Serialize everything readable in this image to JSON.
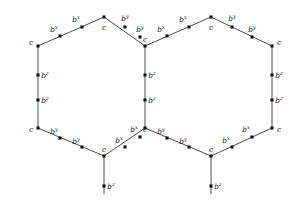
{
  "figure": {
    "type": "labeled-graph-diagram",
    "colors": {
      "edge": "#3a3a3a",
      "node": "#141414",
      "label": "#1a1a1a",
      "background": "#ffffff"
    },
    "labels": {
      "corner": "c",
      "b": "b",
      "sup_x": "x",
      "sup_y": "y",
      "sup_z": "z"
    },
    "vertices": [
      {
        "id": "c-top-left",
        "kind": "corner",
        "label": "c",
        "sup": "",
        "x": 38,
        "y": 46,
        "lx": 31,
        "ly": 45
      },
      {
        "id": "c-top-mid-left",
        "kind": "corner",
        "label": "c",
        "sup": "",
        "x": 104,
        "y": 17,
        "lx": 104,
        "ly": 30
      },
      {
        "id": "c-center-top",
        "kind": "corner",
        "label": "c",
        "sup": "",
        "x": 145,
        "y": 46,
        "lx": 145,
        "ly": 42
      },
      {
        "id": "c-top-mid-right",
        "kind": "corner",
        "label": "c",
        "sup": "",
        "x": 211,
        "y": 17,
        "lx": 211,
        "ly": 30
      },
      {
        "id": "c-top-right",
        "kind": "corner",
        "label": "c",
        "sup": "",
        "x": 272,
        "y": 46,
        "lx": 279,
        "ly": 45
      },
      {
        "id": "c-bot-left",
        "kind": "corner",
        "label": "c",
        "sup": "",
        "x": 38,
        "y": 128,
        "lx": 31,
        "ly": 132
      },
      {
        "id": "c-bot-mid-left",
        "kind": "corner",
        "label": "c",
        "sup": "",
        "x": 104,
        "y": 156,
        "lx": 104,
        "ly": 152
      },
      {
        "id": "c-center-bot",
        "kind": "corner",
        "label": "c",
        "sup": "",
        "x": 145,
        "y": 128,
        "lx": 145,
        "ly": 132
      },
      {
        "id": "c-bot-mid-right",
        "kind": "corner",
        "label": "c",
        "sup": "",
        "x": 211,
        "y": 156,
        "lx": 211,
        "ly": 152
      },
      {
        "id": "c-bot-right",
        "kind": "corner",
        "label": "c",
        "sup": "",
        "x": 272,
        "y": 128,
        "lx": 279,
        "ly": 132
      },
      {
        "id": "b-tl-1",
        "kind": "mid",
        "label": "b",
        "sup": "x",
        "x": 60,
        "y": 36,
        "lx": 54,
        "ly": 32
      },
      {
        "id": "b-tl-2",
        "kind": "mid",
        "label": "b",
        "sup": "x",
        "x": 82,
        "y": 27,
        "lx": 76,
        "ly": 22
      },
      {
        "id": "b-tr-1",
        "kind": "mid",
        "label": "b",
        "sup": "y",
        "x": 125,
        "y": 27,
        "lx": 125,
        "ly": 21
      },
      {
        "id": "b-tr-2",
        "kind": "mid",
        "label": "b",
        "sup": "y",
        "x": 140,
        "y": 37,
        "lx": 140,
        "ly": 32
      },
      {
        "id": "b-tl2-1",
        "kind": "mid",
        "label": "b",
        "sup": "x",
        "x": 167,
        "y": 36,
        "lx": 161,
        "ly": 32
      },
      {
        "id": "b-tl2-2",
        "kind": "mid",
        "label": "b",
        "sup": "x",
        "x": 189,
        "y": 27,
        "lx": 183,
        "ly": 22
      },
      {
        "id": "b-tr2-1",
        "kind": "mid",
        "label": "b",
        "sup": "y",
        "x": 232,
        "y": 27,
        "lx": 232,
        "ly": 21
      },
      {
        "id": "b-tr2-2",
        "kind": "mid",
        "label": "b",
        "sup": "y",
        "x": 252,
        "y": 37,
        "lx": 252,
        "ly": 32
      },
      {
        "id": "b-lv-1",
        "kind": "mid",
        "label": "b",
        "sup": "z",
        "x": 38,
        "y": 75,
        "lx": 45,
        "ly": 78
      },
      {
        "id": "b-lv-2",
        "kind": "mid",
        "label": "b",
        "sup": "z",
        "x": 38,
        "y": 100,
        "lx": 45,
        "ly": 103
      },
      {
        "id": "b-cv-1",
        "kind": "mid",
        "label": "b",
        "sup": "z",
        "x": 145,
        "y": 75,
        "lx": 152,
        "ly": 78
      },
      {
        "id": "b-cv-2",
        "kind": "mid",
        "label": "b",
        "sup": "z",
        "x": 145,
        "y": 100,
        "lx": 152,
        "ly": 103
      },
      {
        "id": "b-rv-1",
        "kind": "mid",
        "label": "b",
        "sup": "z",
        "x": 272,
        "y": 75,
        "lx": 279,
        "ly": 78
      },
      {
        "id": "b-rv-2",
        "kind": "mid",
        "label": "b",
        "sup": "z",
        "x": 272,
        "y": 100,
        "lx": 279,
        "ly": 103
      },
      {
        "id": "b-bl-1",
        "kind": "mid",
        "label": "b",
        "sup": "y",
        "x": 60,
        "y": 138,
        "lx": 54,
        "ly": 134
      },
      {
        "id": "b-bl-2",
        "kind": "mid",
        "label": "b",
        "sup": "y",
        "x": 82,
        "y": 147,
        "lx": 76,
        "ly": 144
      },
      {
        "id": "b-br-1",
        "kind": "mid",
        "label": "b",
        "sup": "x",
        "x": 125,
        "y": 147,
        "lx": 119,
        "ly": 143
      },
      {
        "id": "b-br-2",
        "kind": "mid",
        "label": "b",
        "sup": "x",
        "x": 140,
        "y": 137,
        "lx": 134,
        "ly": 132
      },
      {
        "id": "b-bl2-1",
        "kind": "mid",
        "label": "b",
        "sup": "y",
        "x": 167,
        "y": 138,
        "lx": 161,
        "ly": 134
      },
      {
        "id": "b-bl2-2",
        "kind": "mid",
        "label": "b",
        "sup": "y",
        "x": 189,
        "y": 147,
        "lx": 183,
        "ly": 144
      },
      {
        "id": "b-br2-1",
        "kind": "mid",
        "label": "b",
        "sup": "x",
        "x": 232,
        "y": 147,
        "lx": 226,
        "ly": 143
      },
      {
        "id": "b-br2-2",
        "kind": "mid",
        "label": "b",
        "sup": "x",
        "x": 252,
        "y": 137,
        "lx": 246,
        "ly": 132
      },
      {
        "id": "b-pend-left",
        "kind": "pendant",
        "label": "b",
        "sup": "z",
        "x": 104,
        "y": 186,
        "lx": 111,
        "ly": 189
      },
      {
        "id": "b-pend-right",
        "kind": "pendant",
        "label": "b",
        "sup": "z",
        "x": 211,
        "y": 186,
        "lx": 218,
        "ly": 189
      }
    ],
    "edges": [
      {
        "id": "e-top-left-up",
        "x1": 38,
        "y1": 46,
        "x2": 104,
        "y2": 17
      },
      {
        "id": "e-top-left-down",
        "x1": 104,
        "y1": 17,
        "x2": 145,
        "y2": 46
      },
      {
        "id": "e-top-right-up",
        "x1": 145,
        "y1": 46,
        "x2": 211,
        "y2": 17
      },
      {
        "id": "e-top-right-down",
        "x1": 211,
        "y1": 17,
        "x2": 272,
        "y2": 46
      },
      {
        "id": "e-left-vertical",
        "x1": 38,
        "y1": 46,
        "x2": 38,
        "y2": 128
      },
      {
        "id": "e-center-vertical",
        "x1": 145,
        "y1": 46,
        "x2": 145,
        "y2": 128
      },
      {
        "id": "e-right-vertical",
        "x1": 272,
        "y1": 46,
        "x2": 272,
        "y2": 128
      },
      {
        "id": "e-bot-left-down",
        "x1": 38,
        "y1": 128,
        "x2": 104,
        "y2": 156
      },
      {
        "id": "e-bot-left-up",
        "x1": 104,
        "y1": 156,
        "x2": 145,
        "y2": 128
      },
      {
        "id": "e-bot-right-down",
        "x1": 145,
        "y1": 128,
        "x2": 211,
        "y2": 156
      },
      {
        "id": "e-bot-right-up",
        "x1": 211,
        "y1": 156,
        "x2": 272,
        "y2": 128
      },
      {
        "id": "e-pendant-left",
        "x1": 104,
        "y1": 156,
        "x2": 104,
        "y2": 194
      },
      {
        "id": "e-pendant-right",
        "x1": 211,
        "y1": 156,
        "x2": 211,
        "y2": 194
      }
    ]
  }
}
